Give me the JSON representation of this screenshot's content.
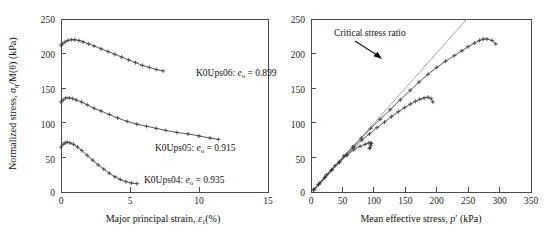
{
  "figure": {
    "title": "",
    "panels": [
      "left",
      "right"
    ]
  },
  "chart_data": [
    {
      "panel": "left",
      "type": "line",
      "title": "",
      "xlabel": "Major principal strain, ε₁(%)",
      "ylabel": "Normalized stress, σq/M(θ) (kPa)",
      "xlim": [
        0,
        15
      ],
      "ylim": [
        0,
        250
      ],
      "xticks": [
        0,
        5,
        10,
        15
      ],
      "yticks": [
        0,
        50,
        100,
        150,
        200,
        250
      ],
      "xticklabels": [
        "0",
        "5",
        "10",
        "15"
      ],
      "yticklabels": [
        "0",
        "50",
        "100",
        "150",
        "200",
        "250"
      ],
      "grid": false,
      "legend_position": "inline-annotations",
      "series": [
        {
          "name": "K0Ups06",
          "label": "K0Ups06: eₒ = 0.899",
          "void_ratio": 0.899,
          "marker": "plus",
          "x": [
            0.0,
            0.12,
            0.3,
            0.5,
            0.75,
            1.0,
            1.3,
            1.6,
            2.0,
            2.4,
            2.9,
            3.4,
            3.9,
            4.4,
            4.9,
            5.4,
            5.9,
            6.4,
            6.9,
            7.4
          ],
          "y": [
            212,
            214,
            217,
            219,
            220,
            220,
            219,
            217,
            214,
            211,
            207,
            203,
            199,
            195,
            191,
            187,
            183,
            180,
            177,
            175
          ]
        },
        {
          "name": "K0Ups05",
          "label": "K0Ups05: eₒ = 0.915",
          "void_ratio": 0.915,
          "marker": "plus",
          "x": [
            0.0,
            0.15,
            0.35,
            0.6,
            0.85,
            1.1,
            1.5,
            1.9,
            2.4,
            2.9,
            3.5,
            4.1,
            4.8,
            5.5,
            6.2,
            6.9,
            7.6,
            8.4,
            9.2,
            10.0,
            10.8,
            11.4
          ],
          "y": [
            130,
            133,
            136,
            136,
            135,
            133,
            130,
            126,
            121,
            117,
            112,
            107,
            102,
            98,
            95,
            92,
            89,
            86,
            84,
            81,
            78,
            76
          ]
        },
        {
          "name": "K0Ups04",
          "label": "K0Ups04: eₒ = 0.935",
          "void_ratio": 0.935,
          "marker": "plus",
          "x": [
            0.0,
            0.15,
            0.3,
            0.45,
            0.65,
            0.9,
            1.2,
            1.5,
            1.9,
            2.3,
            2.7,
            3.1,
            3.5,
            3.9,
            4.3,
            4.7,
            5.1,
            5.5
          ],
          "y": [
            65,
            69,
            71,
            72,
            71,
            69,
            65,
            60,
            53,
            46,
            39,
            33,
            27,
            22,
            18,
            15,
            13,
            12
          ]
        }
      ]
    },
    {
      "panel": "right",
      "type": "line",
      "title": "",
      "xlabel": "Mean effective stress, p′ (kPa)",
      "ylabel": "",
      "xlim": [
        0,
        350
      ],
      "ylim": [
        0,
        250
      ],
      "xticks": [
        0,
        50,
        100,
        150,
        200,
        250,
        300,
        350
      ],
      "yticks": [
        0,
        50,
        100,
        150,
        200,
        250
      ],
      "xticklabels": [
        "0",
        "50",
        "100",
        "150",
        "200",
        "250",
        "300",
        "350"
      ],
      "yticklabels": [
        "0",
        "50",
        "100",
        "150",
        "200",
        "250"
      ],
      "grid": false,
      "annotations": [
        {
          "text": "Critical stress ratio",
          "target_x": 175,
          "target_y": 205,
          "type": "arrow-label"
        }
      ],
      "series": [
        {
          "name": "critical-stress-ratio-line",
          "label": "Critical stress ratio",
          "type": "reference-line",
          "x": [
            3,
            248
          ],
          "y": [
            0,
            250
          ],
          "slope": 1.02,
          "style": "thin-gray"
        },
        {
          "name": "K0Ups06",
          "label": "K0Ups06",
          "marker": "plus",
          "x": [
            5,
            14,
            25,
            38,
            52,
            66,
            80,
            95,
            110,
            126,
            142,
            158,
            172,
            186,
            200,
            214,
            228,
            240,
            250,
            260,
            268,
            274,
            280,
            288,
            294
          ],
          "y": [
            4,
            13,
            25,
            38,
            52,
            65,
            78,
            92,
            105,
            119,
            133,
            147,
            159,
            170,
            180,
            189,
            197,
            204,
            210,
            215,
            219,
            221,
            221,
            219,
            214
          ]
        },
        {
          "name": "K0Ups05",
          "label": "K0Ups05",
          "marker": "plus",
          "x": [
            4,
            12,
            22,
            33,
            45,
            57,
            69,
            81,
            93,
            105,
            117,
            128,
            139,
            149,
            158,
            166,
            173,
            180,
            186,
            191,
            194
          ],
          "y": [
            3,
            11,
            21,
            32,
            43,
            54,
            65,
            75,
            84,
            93,
            101,
            109,
            116,
            122,
            127,
            131,
            134,
            136,
            137,
            135,
            130
          ]
        },
        {
          "name": "K0Ups04",
          "label": "K0Ups04",
          "marker": "plus",
          "x": [
            4,
            12,
            22,
            33,
            45,
            57,
            68,
            78,
            86,
            92,
            95,
            96,
            95,
            94,
            93
          ],
          "y": [
            3,
            11,
            21,
            32,
            43,
            53,
            61,
            66,
            69,
            71,
            71,
            70,
            67,
            64,
            63
          ]
        }
      ]
    }
  ],
  "axes": {
    "left": {
      "ylabel_parts": {
        "main": "Normalized stress, ",
        "sigma": "σ",
        "sigma_sub": "q",
        "mid": "/M(θ) (kPa)"
      },
      "xlabel_parts": {
        "main": "Major principal strain, ",
        "eps": "ε",
        "eps_sub": "1",
        "tail": "(%)"
      }
    },
    "right": {
      "xlabel_parts": {
        "main": "Mean effective stress, ",
        "p": "p′",
        "tail": " (kPa)"
      }
    }
  },
  "series_labels": {
    "ups06": {
      "name": "K0Ups06",
      "prefix": "K0Ups06: ",
      "e": "e",
      "e_sub": "o",
      "eq": " = 0.899"
    },
    "ups05": {
      "name": "K0Ups05",
      "prefix": "K0Ups05: ",
      "e": "e",
      "e_sub": "o",
      "eq": " = 0.915"
    },
    "ups04": {
      "name": "K0Ups04",
      "prefix": "K0Ups04: ",
      "e": "e",
      "e_sub": "o",
      "eq": " = 0.935"
    }
  },
  "annotation": {
    "critical_stress_ratio": "Critical stress ratio"
  },
  "colors": {
    "axis": "#4a4a4a",
    "data": "#3a3a3a",
    "reference": "#9a9a9a",
    "text": "#111111",
    "background": "#ffffff"
  }
}
